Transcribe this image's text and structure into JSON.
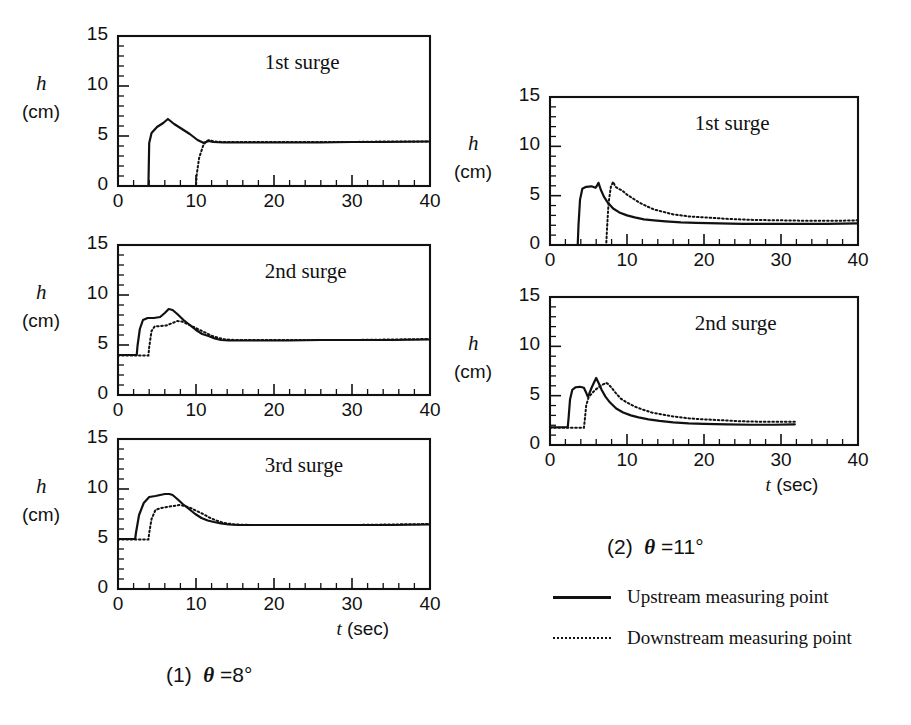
{
  "figure": {
    "background": "#ffffff",
    "ink": "#111111"
  },
  "groups": [
    {
      "id": "theta8",
      "caption_prefix": "(1)",
      "caption_theta": "θ",
      "caption_value": "=8°",
      "caption_full": "(1)  θ =8°",
      "xaxis_title_symbol": "t",
      "xaxis_title_unit": "(sec)"
    },
    {
      "id": "theta11",
      "caption_prefix": "(2)",
      "caption_theta": "θ",
      "caption_value": "=11°",
      "caption_full": "(2)  θ =11°",
      "xaxis_title_symbol": "t",
      "xaxis_title_unit": "(sec)"
    }
  ],
  "legend": {
    "items": [
      {
        "style": "solid",
        "label": "Upstream measuring point"
      },
      {
        "style": "dotted",
        "label": "Downstream measuring point"
      }
    ]
  },
  "axes_common": {
    "ylabel_symbol": "h",
    "ylabel_unit": "(cm)",
    "ytick_labels": [
      "15",
      "10",
      "5",
      "0"
    ],
    "xtick_labels": [
      "0",
      "10",
      "20",
      "30",
      "40"
    ],
    "ylim": [
      0,
      15
    ],
    "xlim": [
      0,
      40
    ],
    "ymajor_step": 5,
    "yminor_step": 1,
    "xmajor_step": 10,
    "xminor_step": 2,
    "grid": false
  },
  "chart_data": [
    {
      "id": "p1",
      "type": "line",
      "title": "1st surge",
      "group": "(1) θ =8°",
      "xlabel": "t (sec)",
      "ylabel": "h (cm)",
      "xlim": [
        0,
        40
      ],
      "ylim": [
        0,
        15
      ],
      "xticks": [
        0,
        10,
        20,
        30,
        40
      ],
      "yticks": [
        0,
        5,
        10,
        15
      ],
      "grid": false,
      "legend": "inside-top-right",
      "series": [
        {
          "name": "Upstream measuring point",
          "style": "solid",
          "x": [
            0,
            3.9,
            4.0,
            4.3,
            5.0,
            5.8,
            6.4,
            7.2,
            8.2,
            9.2,
            10.2,
            11.0,
            11.6,
            12.2,
            13.5,
            15.0,
            18.0,
            22.0,
            26.0,
            30.0,
            34.0,
            40.0
          ],
          "y": [
            0,
            0,
            4.3,
            5.3,
            5.9,
            6.3,
            6.7,
            6.2,
            5.7,
            5.2,
            4.6,
            4.3,
            4.5,
            4.4,
            4.35,
            4.35,
            4.35,
            4.35,
            4.35,
            4.4,
            4.4,
            4.45
          ]
        },
        {
          "name": "Downstream measuring point",
          "style": "dotted",
          "x": [
            0,
            10.0,
            10.1,
            10.4,
            10.9,
            11.3,
            11.7,
            12.3,
            13.5,
            15.0,
            18.0,
            22.0,
            26.0,
            30.0,
            34.0,
            40.0
          ],
          "y": [
            0,
            0,
            1.2,
            2.8,
            4.0,
            4.5,
            4.6,
            4.45,
            4.4,
            4.4,
            4.4,
            4.4,
            4.4,
            4.4,
            4.45,
            4.45
          ]
        }
      ]
    },
    {
      "id": "p2",
      "type": "line",
      "title": "2nd surge",
      "group": "(1) θ =8°",
      "xlabel": "t (sec)",
      "ylabel": "h (cm)",
      "xlim": [
        0,
        40
      ],
      "ylim": [
        0,
        15
      ],
      "xticks": [
        0,
        10,
        20,
        30,
        40
      ],
      "yticks": [
        0,
        5,
        10,
        15
      ],
      "grid": false,
      "legend": "inside-top-right",
      "series": [
        {
          "name": "Upstream measuring point",
          "style": "solid",
          "x": [
            0,
            2.4,
            2.5,
            2.8,
            3.2,
            3.8,
            4.6,
            5.4,
            6.0,
            6.5,
            7.0,
            7.6,
            8.4,
            9.2,
            10.0,
            10.8,
            11.6,
            12.4,
            13.2,
            14.2,
            15.5,
            18.0,
            22.0,
            26.0,
            30.0,
            35.0,
            40.0
          ],
          "y": [
            4.0,
            4.0,
            4.9,
            6.6,
            7.5,
            7.7,
            7.7,
            7.8,
            8.2,
            8.6,
            8.5,
            8.1,
            7.5,
            7.0,
            6.5,
            6.1,
            5.9,
            5.65,
            5.5,
            5.45,
            5.45,
            5.45,
            5.45,
            5.5,
            5.5,
            5.5,
            5.55
          ]
        },
        {
          "name": "Downstream measuring point",
          "style": "dotted",
          "x": [
            0,
            3.9,
            4.0,
            4.3,
            4.7,
            5.4,
            6.2,
            7.0,
            7.6,
            8.2,
            8.9,
            9.7,
            10.5,
            11.3,
            12.1,
            12.9,
            13.8,
            15.0,
            18.0,
            22.0,
            26.0,
            30.0,
            35.0,
            40.0
          ],
          "y": [
            3.95,
            3.95,
            4.8,
            6.4,
            6.85,
            6.9,
            6.95,
            7.2,
            7.4,
            7.35,
            7.1,
            6.8,
            6.5,
            6.2,
            5.9,
            5.7,
            5.55,
            5.5,
            5.5,
            5.5,
            5.5,
            5.5,
            5.55,
            5.6
          ]
        }
      ]
    },
    {
      "id": "p3",
      "type": "line",
      "title": "3rd surge",
      "group": "(1) θ =8°",
      "xlabel": "t (sec)",
      "ylabel": "h (cm)",
      "xlim": [
        0,
        40
      ],
      "ylim": [
        0,
        15
      ],
      "xticks": [
        0,
        10,
        20,
        30,
        40
      ],
      "yticks": [
        0,
        5,
        10,
        15
      ],
      "grid": false,
      "legend": "inside-top-right",
      "series": [
        {
          "name": "Upstream measuring point",
          "style": "solid",
          "x": [
            0,
            2.2,
            2.3,
            2.7,
            3.3,
            4.0,
            4.8,
            5.4,
            6.0,
            6.6,
            7.0,
            7.6,
            8.3,
            9.1,
            9.9,
            10.7,
            11.5,
            12.3,
            13.2,
            14.2,
            15.5,
            17.5,
            21.0,
            25.0,
            30.0,
            35.0,
            40.0
          ],
          "y": [
            5.0,
            5.0,
            5.6,
            7.4,
            8.6,
            9.2,
            9.3,
            9.4,
            9.5,
            9.5,
            9.4,
            9.0,
            8.5,
            8.0,
            7.5,
            7.1,
            6.85,
            6.7,
            6.55,
            6.45,
            6.4,
            6.4,
            6.4,
            6.4,
            6.4,
            6.4,
            6.45
          ]
        },
        {
          "name": "Downstream measuring point",
          "style": "dotted",
          "x": [
            0,
            3.9,
            4.0,
            4.3,
            4.8,
            5.5,
            6.3,
            7.1,
            7.9,
            8.6,
            9.3,
            10.1,
            10.9,
            11.7,
            12.6,
            13.6,
            15.0,
            17.5,
            21.0,
            25.0,
            30.0,
            35.0,
            40.0
          ],
          "y": [
            4.95,
            4.95,
            5.6,
            7.0,
            7.9,
            8.1,
            8.2,
            8.3,
            8.4,
            8.3,
            8.1,
            7.8,
            7.5,
            7.15,
            6.85,
            6.6,
            6.45,
            6.4,
            6.4,
            6.4,
            6.4,
            6.45,
            6.5
          ]
        }
      ]
    },
    {
      "id": "p4",
      "type": "line",
      "title": "1st surge",
      "group": "(2) θ =11°",
      "xlabel": "t (sec)",
      "ylabel": "h (cm)",
      "xlim": [
        0,
        40
      ],
      "ylim": [
        0,
        15
      ],
      "xticks": [
        0,
        10,
        20,
        30,
        40
      ],
      "yticks": [
        0,
        5,
        10,
        15
      ],
      "grid": false,
      "legend": "inside-top-right",
      "series": [
        {
          "name": "Upstream measuring point",
          "style": "solid",
          "x": [
            0,
            3.6,
            3.7,
            3.9,
            4.2,
            4.7,
            5.4,
            5.9,
            6.1,
            6.3,
            6.6,
            7.0,
            7.5,
            8.2,
            9.0,
            10.0,
            11.0,
            12.2,
            13.5,
            15.0,
            17.0,
            19.0,
            22.0,
            25.0,
            28.0,
            32.0,
            36.0,
            40.0
          ],
          "y": [
            0,
            0,
            2.0,
            4.6,
            5.7,
            5.9,
            5.95,
            5.8,
            6.0,
            6.3,
            5.6,
            4.9,
            4.3,
            3.7,
            3.3,
            3.0,
            2.8,
            2.6,
            2.5,
            2.4,
            2.3,
            2.25,
            2.2,
            2.15,
            2.15,
            2.15,
            2.15,
            2.2
          ]
        },
        {
          "name": "Downstream measuring point",
          "style": "dotted",
          "x": [
            0,
            7.3,
            7.4,
            7.6,
            7.9,
            8.2,
            8.5,
            8.9,
            9.4,
            10.0,
            10.8,
            11.6,
            12.5,
            13.5,
            14.5,
            16.0,
            18.0,
            20.0,
            23.0,
            26.0,
            30.0,
            34.0,
            37.0,
            40.0
          ],
          "y": [
            0,
            0,
            1.6,
            4.2,
            5.9,
            6.4,
            5.9,
            5.7,
            5.5,
            5.1,
            4.7,
            4.3,
            3.95,
            3.6,
            3.4,
            3.1,
            2.9,
            2.8,
            2.65,
            2.55,
            2.5,
            2.45,
            2.45,
            2.5
          ]
        }
      ]
    },
    {
      "id": "p5",
      "type": "line",
      "title": "2nd surge",
      "group": "(2) θ =11°",
      "xlabel": "t (sec)",
      "ylabel": "h (cm)",
      "xlim": [
        0,
        40
      ],
      "ylim": [
        0,
        15
      ],
      "xticks": [
        0,
        10,
        20,
        30,
        40
      ],
      "yticks": [
        0,
        5,
        10,
        15
      ],
      "grid": false,
      "legend": "inside-top-right",
      "series": [
        {
          "name": "Upstream measuring point",
          "style": "solid",
          "x": [
            0,
            2.3,
            2.4,
            2.6,
            2.9,
            3.3,
            3.9,
            4.4,
            4.7,
            4.9,
            5.1,
            5.4,
            5.7,
            6.0,
            6.3,
            6.7,
            7.2,
            7.8,
            8.6,
            9.5,
            10.5,
            11.5,
            12.8,
            14.2,
            16.0,
            18.0,
            20.0,
            23.0,
            26.0,
            29.0,
            31.8
          ],
          "y": [
            1.8,
            1.8,
            2.6,
            4.6,
            5.6,
            5.85,
            5.9,
            5.8,
            5.3,
            4.9,
            5.2,
            5.8,
            6.3,
            6.8,
            6.3,
            5.6,
            4.9,
            4.3,
            3.7,
            3.3,
            3.0,
            2.8,
            2.6,
            2.45,
            2.3,
            2.2,
            2.15,
            2.1,
            2.05,
            2.05,
            2.1
          ]
        },
        {
          "name": "Downstream measuring point",
          "style": "dotted",
          "x": [
            0,
            4.4,
            4.5,
            4.7,
            5.0,
            5.4,
            5.9,
            6.4,
            6.9,
            7.3,
            7.6,
            8.0,
            8.5,
            9.2,
            10.0,
            11.0,
            12.0,
            13.2,
            14.5,
            16.0,
            18.0,
            20.0,
            22.5,
            25.0,
            28.0,
            31.8
          ],
          "y": [
            1.75,
            1.75,
            2.4,
            4.0,
            4.8,
            5.2,
            5.6,
            5.9,
            6.15,
            6.3,
            6.15,
            5.8,
            5.3,
            4.7,
            4.3,
            3.9,
            3.6,
            3.3,
            3.1,
            2.9,
            2.7,
            2.6,
            2.5,
            2.4,
            2.35,
            2.35
          ]
        }
      ]
    }
  ]
}
